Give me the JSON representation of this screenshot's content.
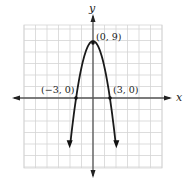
{
  "chart_data": {
    "type": "line",
    "title": "",
    "xlabel": "x",
    "ylabel": "y",
    "function": "y = -x^2 + 9",
    "xlim": [
      -12,
      12
    ],
    "ylim": [
      -12,
      12
    ],
    "grid": true,
    "grid_step": 2,
    "legend": null,
    "series": [
      {
        "name": "parabola",
        "color": "#1a1a1a",
        "x": [
          -4.3,
          -4,
          -3,
          -2,
          -1,
          0,
          1,
          2,
          3,
          4,
          4.3
        ],
        "y": [
          -9.5,
          -7,
          0,
          5,
          8,
          9,
          8,
          5,
          0,
          -7,
          -9.5
        ]
      }
    ],
    "points": [
      {
        "label": "(0, 9)",
        "x": 0,
        "y": 9
      },
      {
        "label": "(−3, 0)",
        "x": -3,
        "y": 0
      },
      {
        "label": "(3, 0)",
        "x": 3,
        "y": 0
      }
    ],
    "axes": {
      "x_label": "x",
      "y_label": "y"
    }
  },
  "colors": {
    "grid": "#d4d4d4",
    "axis": "#555555",
    "curve": "#1a1a1a",
    "text": "#222222"
  }
}
